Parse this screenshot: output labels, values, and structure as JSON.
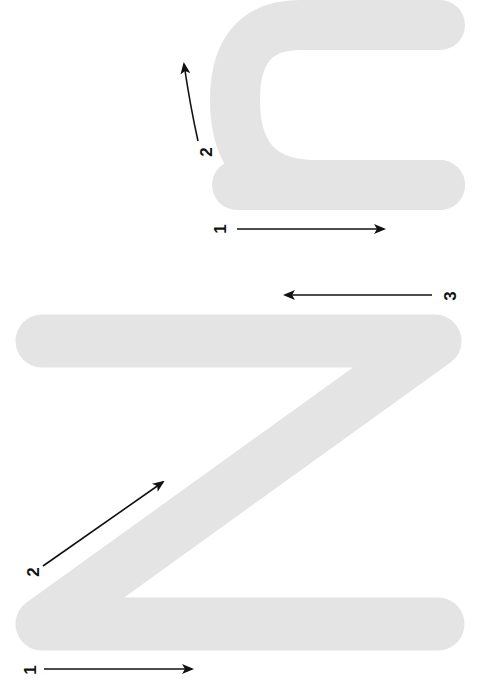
{
  "diagram": {
    "colors": {
      "letter_fill": "#e4e4e4",
      "arrow": "#111111",
      "background": "#ffffff"
    },
    "lowercase_n": {
      "letter": "n",
      "strokes": [
        {
          "number": "1",
          "label": "1",
          "direction": "down the stem"
        },
        {
          "number": "2",
          "label": "2",
          "direction": "up and over the arch"
        }
      ]
    },
    "uppercase_n": {
      "letter": "N",
      "strokes": [
        {
          "number": "1",
          "label": "1",
          "direction": "down the left stem"
        },
        {
          "number": "2",
          "label": "2",
          "direction": "diagonal"
        },
        {
          "number": "3",
          "label": "3",
          "direction": "up the right stem"
        }
      ]
    }
  }
}
